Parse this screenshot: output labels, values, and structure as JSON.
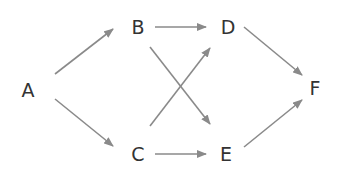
{
  "diagram": {
    "type": "directed-graph",
    "colors": {
      "node_text": "#333333",
      "edge": "#8a8a8a",
      "background": "#ffffff"
    },
    "nodes": [
      {
        "id": "A",
        "label": "A",
        "x": 28,
        "y": 90
      },
      {
        "id": "B",
        "label": "B",
        "x": 138,
        "y": 27
      },
      {
        "id": "C",
        "label": "C",
        "x": 138,
        "y": 154
      },
      {
        "id": "D",
        "label": "D",
        "x": 228,
        "y": 27
      },
      {
        "id": "E",
        "label": "E",
        "x": 226,
        "y": 154
      },
      {
        "id": "F",
        "label": "F",
        "x": 315,
        "y": 88
      }
    ],
    "edges": [
      {
        "from": "A",
        "to": "B",
        "x1": 55,
        "y1": 74,
        "x2": 113,
        "y2": 29
      },
      {
        "from": "A",
        "to": "C",
        "x1": 55,
        "y1": 99,
        "x2": 113,
        "y2": 146
      },
      {
        "from": "B",
        "to": "D",
        "x1": 155,
        "y1": 27,
        "x2": 206,
        "y2": 27
      },
      {
        "from": "B",
        "to": "E",
        "x1": 150,
        "y1": 47,
        "x2": 210,
        "y2": 124
      },
      {
        "from": "C",
        "to": "D",
        "x1": 150,
        "y1": 126,
        "x2": 210,
        "y2": 48
      },
      {
        "from": "C",
        "to": "E",
        "x1": 155,
        "y1": 154,
        "x2": 206,
        "y2": 154
      },
      {
        "from": "D",
        "to": "F",
        "x1": 244,
        "y1": 27,
        "x2": 302,
        "y2": 75
      },
      {
        "from": "E",
        "to": "F",
        "x1": 244,
        "y1": 147,
        "x2": 302,
        "y2": 100
      }
    ]
  }
}
